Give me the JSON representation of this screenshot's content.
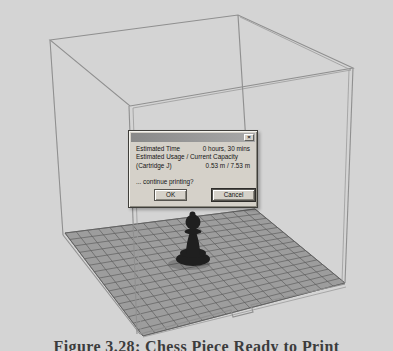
{
  "dialog": {
    "close_icon": "×",
    "rows": [
      {
        "label": "Estimated Time",
        "value": "0 hours, 30 mins"
      },
      {
        "label": "Estimated Usage / Current Capacity",
        "value": ""
      },
      {
        "label": "(Cartridge J)",
        "value": "0.53 m / 7.53 m"
      }
    ],
    "question": "... continue printing?",
    "buttons": {
      "ok": "OK",
      "cancel": "Cancel"
    }
  },
  "scene": {
    "object": "chess-pawn-on-build-platform",
    "colors": {
      "background": "#d4d4d4",
      "cube_line": "#8f8f8f",
      "platform_fill": "#9d9d9d",
      "platform_edge": "#6a6a6a",
      "grid_line": "#5f5f5f",
      "pawn": "#1f1f1f"
    }
  },
  "caption": "Figure 3.28: Chess Piece Ready to Print"
}
